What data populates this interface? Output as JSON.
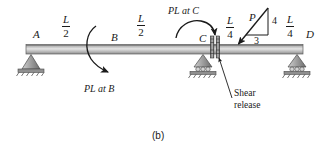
{
  "figure": {
    "caption": "(b)",
    "beam": {
      "points": [
        {
          "id": "A",
          "label": "A"
        },
        {
          "id": "B",
          "label": "B"
        },
        {
          "id": "C",
          "label": "C"
        },
        {
          "id": "D",
          "label": "D"
        }
      ]
    },
    "dimensions": [
      {
        "id": "dim-a-b",
        "numerator": "L",
        "denominator": "2"
      },
      {
        "id": "dim-b-c",
        "numerator": "L",
        "denominator": "2"
      },
      {
        "id": "dim-c-p",
        "numerator": "L",
        "denominator": "4"
      },
      {
        "id": "dim-p-d",
        "numerator": "L",
        "denominator": "4"
      }
    ],
    "moments": [
      {
        "id": "moment-b",
        "label": "PL at B",
        "sense": "clockwise"
      },
      {
        "id": "moment-c",
        "label": "PL at C",
        "sense": "clockwise"
      }
    ],
    "load": {
      "force_label": "P",
      "slope_vertical": "4",
      "slope_horizontal": "3"
    },
    "annotations": [
      {
        "id": "shear-release",
        "line1": "Shear",
        "line2": "release"
      }
    ],
    "supports": [
      {
        "id": "support-a",
        "type": "pin"
      },
      {
        "id": "support-c",
        "type": "roller"
      },
      {
        "id": "support-d",
        "type": "roller"
      }
    ],
    "colors": {
      "ink": "#1a1a1a",
      "beam_dark": "#6f6f6f",
      "beam_light": "#e8e8e8",
      "support_fill": "#9a9a9a",
      "hatch": "#4a4a4a"
    }
  }
}
